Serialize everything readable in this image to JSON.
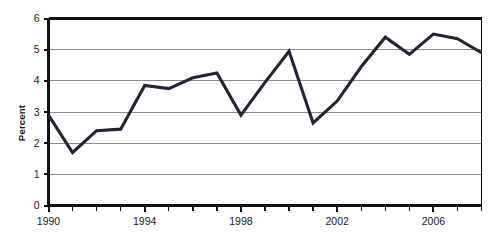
{
  "chart_data": {
    "type": "line",
    "title": "",
    "subtitle": "",
    "xlabel": "",
    "ylabel": "Percent",
    "xlim": [
      1990,
      2008
    ],
    "ylim": [
      0,
      6
    ],
    "grid": true,
    "legend": "none",
    "y_ticks": [
      0,
      1,
      2,
      3,
      4,
      5,
      6
    ],
    "y_tick_labels": [
      "0",
      "1",
      "2",
      "3",
      "4",
      "5",
      "6"
    ],
    "x_ticks": [
      1990,
      1991,
      1992,
      1993,
      1994,
      1995,
      1996,
      1997,
      1998,
      1999,
      2000,
      2001,
      2002,
      2003,
      2004,
      2005,
      2006,
      2007,
      2008
    ],
    "x_tick_labels": [
      "1990",
      "",
      "",
      "",
      "1994",
      "",
      "",
      "",
      "1998",
      "",
      "",
      "",
      "2002",
      "",
      "",
      "",
      "2006",
      "",
      ""
    ],
    "x_labeled_ticks": [
      {
        "value": 1990,
        "label": "1990"
      },
      {
        "value": 1994,
        "label": "1994"
      },
      {
        "value": 1998,
        "label": "1998"
      },
      {
        "value": 2002,
        "label": "2002"
      },
      {
        "value": 2006,
        "label": "2006"
      }
    ],
    "line_color": "#242436",
    "grid_color": "#8a8a8a",
    "axis_color": "#111111",
    "x": [
      1990,
      1991,
      1992,
      1993,
      1994,
      1995,
      1996,
      1997,
      1998,
      1999,
      2000,
      2001,
      2002,
      2003,
      2004,
      2005,
      2006,
      2007,
      2008
    ],
    "values": [
      2.9,
      1.7,
      2.4,
      2.45,
      3.85,
      3.75,
      4.1,
      4.25,
      2.9,
      3.95,
      4.95,
      2.65,
      3.35,
      4.45,
      5.4,
      4.85,
      5.5,
      5.35,
      4.9
    ],
    "series": [
      {
        "name": "Percent",
        "values": [
          2.9,
          1.7,
          2.4,
          2.45,
          3.85,
          3.75,
          4.1,
          4.25,
          2.9,
          3.95,
          4.95,
          2.65,
          3.35,
          4.45,
          5.4,
          4.85,
          5.5,
          5.35,
          4.9
        ]
      }
    ]
  }
}
